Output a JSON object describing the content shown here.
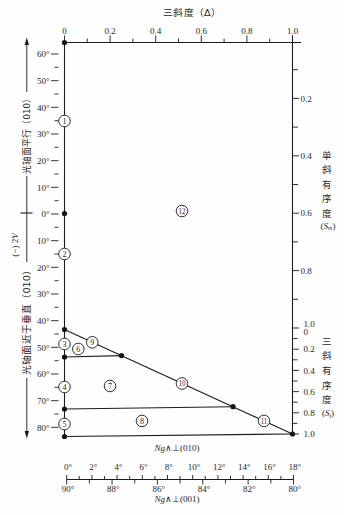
{
  "top_axis": {
    "title": "三斜度（Δ）",
    "tick_labels": [
      "0",
      "0.2",
      "0.4",
      "0.6",
      "0.8",
      "1.0"
    ]
  },
  "left_axis": {
    "tick_labels": [
      "60°",
      "50°",
      "40°",
      "30°",
      "20°",
      "10°",
      "0°",
      "10°",
      "20°",
      "30°",
      "40°",
      "50°",
      "60°",
      "70°",
      "80°"
    ],
    "upper_label": "光轴面平行（010）",
    "middle_label": {
      "prefix": "(−) 2",
      "symbol": "V"
    },
    "lower_label": "光轴面近于垂直（010）"
  },
  "right_axis": {
    "monoclinic": {
      "tick_labels": [
        "0.2",
        "0.4",
        "0.6",
        "0.8",
        "1.0"
      ],
      "title_chars": [
        "单",
        "斜",
        "有",
        "序",
        "度"
      ],
      "open": "(",
      "symbol": "S",
      "subscript": "m",
      "close": ")"
    },
    "triclinic": {
      "tick_labels": [
        "0",
        "0.2",
        "0.4",
        "0.6",
        "0.8",
        "1.0"
      ],
      "title_chars": [
        "三",
        "斜",
        "有",
        "序",
        "度"
      ],
      "open": "(",
      "symbol": "S",
      "subscript": "t",
      "close": ")"
    }
  },
  "bottom_axis": {
    "upper_title": {
      "symbol": "Ng",
      "rest": "∧⊥(010)"
    },
    "upper_tick_labels": [
      "0°",
      "2°",
      "4°",
      "6°",
      "8°",
      "10°",
      "12°",
      "14°",
      "16°",
      "18°"
    ],
    "lower_tick_labels": [
      "90°",
      "88°",
      "86°",
      "84°",
      "82°",
      "80°"
    ],
    "lower_title": {
      "symbol": "Ng",
      "rest": "∧⊥(001)"
    }
  },
  "fields": [
    "1",
    "2",
    "3",
    "4",
    "5",
    "6",
    "7",
    "8",
    "9",
    "10",
    "11",
    "12"
  ],
  "colors": {
    "ink": "#1c1c1c",
    "background": "#fefefe"
  }
}
